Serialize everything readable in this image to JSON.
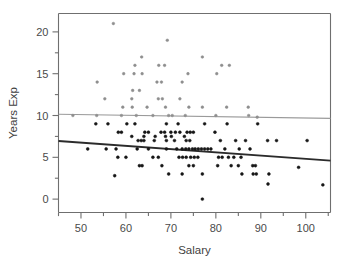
{
  "chart_data": {
    "type": "scatter",
    "title": "",
    "xlabel": "Salary",
    "ylabel": "Years Exp",
    "xlim": [
      45,
      105.5
    ],
    "ylim": [
      -1.6,
      22.2
    ],
    "grid": false,
    "legend": "none",
    "x_ticks": [
      50,
      60,
      70,
      80,
      90,
      100
    ],
    "y_ticks": [
      0,
      5,
      10,
      15,
      20
    ],
    "x_minor_step": 5,
    "y_minor_step": 2.5,
    "series": [
      {
        "name": "upper-group",
        "marker": "dot",
        "color": "#8e8e8e",
        "points": [
          [
            57.2,
            21.0
          ],
          [
            69.2,
            19.0
          ],
          [
            63.5,
            17.0
          ],
          [
            77.0,
            17.0
          ],
          [
            62.0,
            16.0
          ],
          [
            67.3,
            16.0
          ],
          [
            68.6,
            16.0
          ],
          [
            81.3,
            16.0
          ],
          [
            83.0,
            16.0
          ],
          [
            59.5,
            15.0
          ],
          [
            61.8,
            15.0
          ],
          [
            63.6,
            15.0
          ],
          [
            73.8,
            15.0
          ],
          [
            80.2,
            15.0
          ],
          [
            53.6,
            14.0
          ],
          [
            66.9,
            14.0
          ],
          [
            67.9,
            14.0
          ],
          [
            72.5,
            14.0
          ],
          [
            61.5,
            13.0
          ],
          [
            63.0,
            13.0
          ],
          [
            55.3,
            12.0
          ],
          [
            61.3,
            12.0
          ],
          [
            67.2,
            12.0
          ],
          [
            68.1,
            12.0
          ],
          [
            72.0,
            12.0
          ],
          [
            59.3,
            11.0
          ],
          [
            61.4,
            11.0
          ],
          [
            64.7,
            11.0
          ],
          [
            68.8,
            11.0
          ],
          [
            74.0,
            11.0
          ],
          [
            77.0,
            11.0
          ],
          [
            82.4,
            11.0
          ],
          [
            87.2,
            11.0
          ],
          [
            48.2,
            10.0
          ],
          [
            53.5,
            10.0
          ],
          [
            59.0,
            10.0
          ],
          [
            62.3,
            10.0
          ],
          [
            66.0,
            10.0
          ],
          [
            69.5,
            10.0
          ],
          [
            70.3,
            10.0
          ],
          [
            73.2,
            10.0
          ],
          [
            80.0,
            10.0
          ],
          [
            87.3,
            10.0
          ],
          [
            89.2,
            9.8
          ]
        ]
      },
      {
        "name": "lower-group",
        "marker": "dot",
        "color": "#171717",
        "points": [
          [
            53.3,
            9.0
          ],
          [
            56.0,
            9.0
          ],
          [
            60.2,
            9.0
          ],
          [
            62.0,
            9.0
          ],
          [
            69.0,
            9.0
          ],
          [
            71.6,
            9.0
          ],
          [
            77.5,
            9.0
          ],
          [
            82.5,
            9.0
          ],
          [
            89.3,
            9.0
          ],
          [
            58.3,
            8.0
          ],
          [
            59.0,
            8.0
          ],
          [
            64.2,
            8.0
          ],
          [
            65.0,
            8.0
          ],
          [
            67.8,
            8.0
          ],
          [
            68.6,
            8.0
          ],
          [
            70.0,
            8.0
          ],
          [
            71.0,
            8.0
          ],
          [
            72.0,
            8.0
          ],
          [
            73.6,
            8.0
          ],
          [
            74.3,
            8.0
          ],
          [
            75.0,
            8.0
          ],
          [
            79.8,
            8.0
          ],
          [
            61.3,
            7.5
          ],
          [
            64.0,
            7.5
          ],
          [
            66.5,
            7.5
          ],
          [
            68.8,
            7.5
          ],
          [
            70.1,
            7.5
          ],
          [
            73.0,
            7.5
          ],
          [
            62.7,
            7.0
          ],
          [
            63.4,
            7.0
          ],
          [
            64.0,
            7.0
          ],
          [
            66.3,
            7.0
          ],
          [
            69.0,
            7.0
          ],
          [
            70.8,
            7.0
          ],
          [
            73.4,
            7.0
          ],
          [
            74.2,
            7.0
          ],
          [
            81.0,
            7.0
          ],
          [
            84.4,
            7.0
          ],
          [
            86.6,
            7.0
          ],
          [
            91.5,
            7.0
          ],
          [
            93.5,
            7.0
          ],
          [
            100.3,
            7.0
          ],
          [
            51.5,
            6.0
          ],
          [
            55.6,
            6.0
          ],
          [
            57.8,
            6.0
          ],
          [
            62.5,
            6.0
          ],
          [
            65.0,
            6.0
          ],
          [
            69.0,
            6.0
          ],
          [
            71.3,
            6.0
          ],
          [
            72.5,
            6.0
          ],
          [
            73.3,
            6.0
          ],
          [
            74.0,
            6.0
          ],
          [
            74.8,
            6.0
          ],
          [
            75.4,
            6.0
          ],
          [
            76.1,
            6.0
          ],
          [
            76.8,
            6.0
          ],
          [
            77.5,
            6.0
          ],
          [
            78.2,
            6.0
          ],
          [
            78.9,
            6.0
          ],
          [
            82.0,
            6.0
          ],
          [
            85.2,
            6.0
          ],
          [
            87.6,
            6.0
          ],
          [
            58.2,
            5.0
          ],
          [
            60.0,
            5.0
          ],
          [
            66.0,
            5.0
          ],
          [
            67.2,
            5.0
          ],
          [
            71.8,
            5.0
          ],
          [
            72.6,
            5.0
          ],
          [
            73.4,
            5.0
          ],
          [
            74.4,
            5.0
          ],
          [
            75.2,
            5.0
          ],
          [
            76.0,
            5.0
          ],
          [
            80.6,
            5.0
          ],
          [
            81.4,
            5.0
          ],
          [
            82.8,
            5.0
          ],
          [
            84.0,
            5.0
          ],
          [
            85.6,
            5.0
          ],
          [
            63.0,
            4.0
          ],
          [
            63.6,
            4.0
          ],
          [
            68.0,
            4.0
          ],
          [
            74.0,
            4.0
          ],
          [
            75.0,
            4.0
          ],
          [
            80.4,
            4.0
          ],
          [
            83.4,
            4.0
          ],
          [
            85.0,
            4.0
          ],
          [
            88.2,
            4.0
          ],
          [
            88.8,
            4.0
          ],
          [
            98.4,
            3.8
          ],
          [
            69.5,
            3.0
          ],
          [
            72.5,
            3.0
          ],
          [
            77.0,
            3.0
          ],
          [
            85.8,
            3.0
          ],
          [
            88.3,
            3.0
          ],
          [
            89.0,
            3.0
          ],
          [
            91.8,
            3.0
          ],
          [
            57.5,
            2.8
          ],
          [
            91.6,
            1.8
          ],
          [
            103.8,
            1.7
          ],
          [
            77.0,
            0.0
          ]
        ]
      }
    ],
    "trend_lines": [
      {
        "name": "upper-trend-line",
        "color": "#9a9a9a",
        "x0": 45.0,
        "y0": 10.15,
        "x1": 105.5,
        "y1": 9.65
      },
      {
        "name": "lower-trend-line",
        "color": "#2b2b2b",
        "x0": 45.0,
        "y0": 6.95,
        "x1": 105.5,
        "y1": 4.6
      }
    ]
  }
}
